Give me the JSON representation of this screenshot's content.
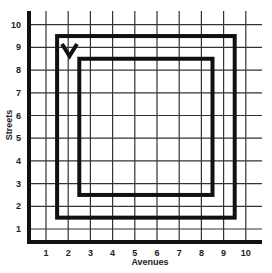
{
  "diagram": {
    "type": "street-grid",
    "x_axis": {
      "title": "Avenues",
      "ticks": [
        "1",
        "2",
        "3",
        "4",
        "5",
        "6",
        "7",
        "8",
        "9",
        "10"
      ]
    },
    "y_axis": {
      "title": "Streets",
      "ticks": [
        "1",
        "2",
        "3",
        "4",
        "5",
        "6",
        "7",
        "8",
        "9",
        "10"
      ]
    },
    "paths": [
      {
        "name": "outer-square",
        "from_avenue": 1.5,
        "to_avenue": 9.5,
        "from_street": 1.5,
        "to_street": 9.5
      },
      {
        "name": "inner-square",
        "from_avenue": 2.5,
        "to_avenue": 8.5,
        "from_street": 2.5,
        "to_street": 8.5
      }
    ],
    "marker": {
      "name": "v-marker",
      "glyph": "V",
      "avenue": 2,
      "street": 9
    },
    "colors": {
      "grid": "#222222",
      "path": "#111111",
      "background": "#ffffff"
    }
  }
}
